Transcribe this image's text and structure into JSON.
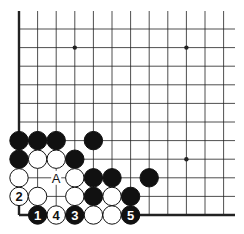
{
  "diagram": {
    "type": "go-board-corner",
    "corner": "lower-left",
    "origin": {
      "x": 19,
      "y": 215
    },
    "spacing": 18.6,
    "columns": 12,
    "rows": 11,
    "line_right_x": 235,
    "line_top_y": 11,
    "stone_radius": 9.2,
    "colors": {
      "black": "#111111",
      "white": "#ffffff",
      "line": "#222222"
    },
    "hoshi": [
      {
        "col": 3,
        "row": 9
      },
      {
        "col": 9,
        "row": 9
      },
      {
        "col": 9,
        "row": 3
      }
    ],
    "stones": [
      {
        "col": 0,
        "row": 4,
        "color": "black",
        "label": ""
      },
      {
        "col": 1,
        "row": 4,
        "color": "black",
        "label": ""
      },
      {
        "col": 2,
        "row": 4,
        "color": "black",
        "label": ""
      },
      {
        "col": 4,
        "row": 4,
        "color": "black",
        "label": ""
      },
      {
        "col": 0,
        "row": 3,
        "color": "black",
        "label": ""
      },
      {
        "col": 1,
        "row": 3,
        "color": "white",
        "label": ""
      },
      {
        "col": 2,
        "row": 3,
        "color": "white",
        "label": ""
      },
      {
        "col": 3,
        "row": 3,
        "color": "black",
        "label": ""
      },
      {
        "col": 0,
        "row": 2,
        "color": "white",
        "label": ""
      },
      {
        "col": 3,
        "row": 2,
        "color": "white",
        "label": ""
      },
      {
        "col": 4,
        "row": 2,
        "color": "black",
        "label": ""
      },
      {
        "col": 5,
        "row": 2,
        "color": "black",
        "label": ""
      },
      {
        "col": 7,
        "row": 2,
        "color": "black",
        "label": ""
      },
      {
        "col": 0,
        "row": 1,
        "color": "white",
        "label": "2"
      },
      {
        "col": 1,
        "row": 1,
        "color": "white",
        "label": ""
      },
      {
        "col": 3,
        "row": 1,
        "color": "white",
        "label": ""
      },
      {
        "col": 4,
        "row": 1,
        "color": "black",
        "label": ""
      },
      {
        "col": 5,
        "row": 1,
        "color": "white",
        "label": ""
      },
      {
        "col": 6,
        "row": 1,
        "color": "black",
        "label": ""
      },
      {
        "col": 1,
        "row": 0,
        "color": "black",
        "label": "1"
      },
      {
        "col": 2,
        "row": 0,
        "color": "white",
        "label": "4"
      },
      {
        "col": 3,
        "row": 0,
        "color": "black",
        "label": "3"
      },
      {
        "col": 4,
        "row": 0,
        "color": "white",
        "label": ""
      },
      {
        "col": 5,
        "row": 0,
        "color": "white",
        "label": ""
      },
      {
        "col": 6,
        "row": 0,
        "color": "black",
        "label": "5"
      }
    ],
    "markers": [
      {
        "col": 2,
        "row": 2,
        "label": "A"
      }
    ]
  }
}
